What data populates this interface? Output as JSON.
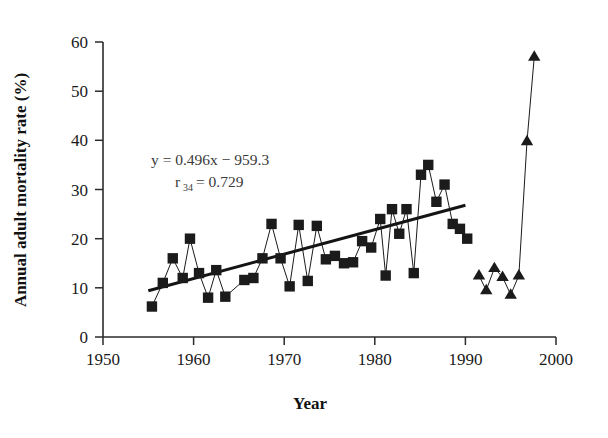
{
  "chart_data": {
    "type": "scatter",
    "title": "",
    "xlabel": "Year",
    "ylabel": "Annual adult mortality rate (%)",
    "xlim": [
      1950,
      2000
    ],
    "ylim": [
      0,
      60
    ],
    "xticks": [
      1950,
      1960,
      1970,
      1980,
      1990,
      2000
    ],
    "yticks": [
      0,
      10,
      20,
      30,
      40,
      50,
      60
    ],
    "grid": false,
    "legend": "none",
    "annotations": [
      {
        "name": "regression-equation",
        "text": "y = 0.496x − 959.3",
        "x": 1967.0,
        "y": 35.0
      },
      {
        "name": "correlation-coefficient",
        "text": "r",
        "subscript": "34",
        "tail": " = 0.729",
        "x": 1968.5,
        "y": 31.5
      }
    ],
    "series": [
      {
        "name": "Annual adult mortality rate (squares, connected)",
        "marker": "square",
        "connected": true,
        "points": [
          {
            "x": 1955.4,
            "y": 6.2
          },
          {
            "x": 1956.6,
            "y": 11.0
          },
          {
            "x": 1957.7,
            "y": 16.0
          },
          {
            "x": 1958.8,
            "y": 12.0
          },
          {
            "x": 1959.6,
            "y": 20.0
          },
          {
            "x": 1960.6,
            "y": 13.0
          },
          {
            "x": 1961.6,
            "y": 8.0
          },
          {
            "x": 1962.5,
            "y": 13.6
          },
          {
            "x": 1963.5,
            "y": 8.2
          },
          {
            "x": 1965.6,
            "y": 11.6
          },
          {
            "x": 1966.6,
            "y": 12.0
          },
          {
            "x": 1967.6,
            "y": 16.0
          },
          {
            "x": 1968.6,
            "y": 23.0
          },
          {
            "x": 1969.6,
            "y": 16.0
          },
          {
            "x": 1970.6,
            "y": 10.3
          },
          {
            "x": 1971.6,
            "y": 22.8
          },
          {
            "x": 1972.6,
            "y": 11.4
          },
          {
            "x": 1973.6,
            "y": 22.6
          },
          {
            "x": 1974.6,
            "y": 15.8
          },
          {
            "x": 1975.6,
            "y": 16.5
          },
          {
            "x": 1976.6,
            "y": 15.0
          },
          {
            "x": 1977.6,
            "y": 15.2
          },
          {
            "x": 1978.6,
            "y": 19.5
          },
          {
            "x": 1979.6,
            "y": 18.2
          },
          {
            "x": 1980.6,
            "y": 24.0
          },
          {
            "x": 1981.2,
            "y": 12.5
          },
          {
            "x": 1981.9,
            "y": 26.0
          },
          {
            "x": 1982.7,
            "y": 21.0
          },
          {
            "x": 1983.5,
            "y": 26.0
          },
          {
            "x": 1984.3,
            "y": 13.0
          },
          {
            "x": 1985.1,
            "y": 33.0
          },
          {
            "x": 1985.9,
            "y": 35.0
          },
          {
            "x": 1986.8,
            "y": 27.5
          },
          {
            "x": 1987.7,
            "y": 31.0
          },
          {
            "x": 1988.6,
            "y": 23.0
          },
          {
            "x": 1989.4,
            "y": 22.0
          },
          {
            "x": 1990.2,
            "y": 20.0
          }
        ]
      },
      {
        "name": "Later years (triangles, connected)",
        "marker": "triangle",
        "connected": true,
        "points": [
          {
            "x": 1991.5,
            "y": 12.5
          },
          {
            "x": 1992.3,
            "y": 9.5
          },
          {
            "x": 1993.2,
            "y": 14.0
          },
          {
            "x": 1994.1,
            "y": 12.2
          },
          {
            "x": 1995.0,
            "y": 8.6
          },
          {
            "x": 1995.9,
            "y": 12.5
          },
          {
            "x": 1996.8,
            "y": 39.8
          },
          {
            "x": 1997.6,
            "y": 57.0
          }
        ]
      },
      {
        "name": "Linear regression trend line",
        "marker": "none",
        "connected": true,
        "is_trend": true,
        "points": [
          {
            "x": 1955.0,
            "y": 9.4
          },
          {
            "x": 1990.0,
            "y": 26.8
          }
        ]
      }
    ]
  },
  "figure": {
    "plot_area": {
      "left": 103,
      "right": 556,
      "top": 42,
      "bottom": 337
    }
  }
}
